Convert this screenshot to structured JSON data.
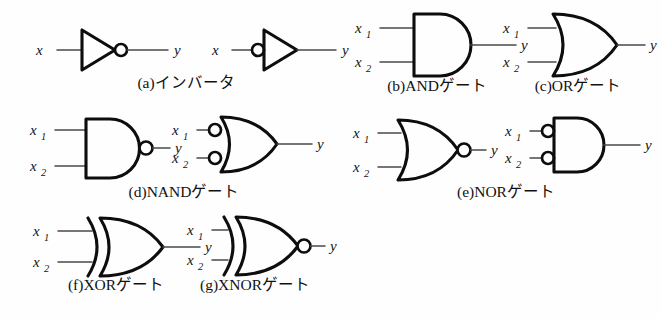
{
  "figure": {
    "background_color": "#fefefe",
    "stroke_color": "#0d0d0d",
    "wire_color": "#4a4a4a",
    "width": 661,
    "height": 318
  },
  "labels": {
    "input_x": "x",
    "input_x1_base": "x",
    "input_x1_sub": "1",
    "input_x2_base": "x",
    "input_x2_sub": "2",
    "output_y": "y"
  },
  "gates": [
    {
      "key": "a",
      "caption": "(a)インバータ",
      "name": "inverter",
      "inputs": [
        "x"
      ],
      "output": "y",
      "variants": [
        "triangle-with-output-bubble",
        "triangle-with-input-bubble"
      ]
    },
    {
      "key": "b",
      "caption": "(b)ANDゲート",
      "name": "and-gate",
      "inputs": [
        "x1",
        "x2"
      ],
      "output": "y",
      "variants": [
        "and-shape"
      ]
    },
    {
      "key": "c",
      "caption": "(c)ORゲート",
      "name": "or-gate",
      "inputs": [
        "x1",
        "x2"
      ],
      "output": "y",
      "variants": [
        "or-shape"
      ]
    },
    {
      "key": "d",
      "caption": "(d)NANDゲート",
      "name": "nand-gate",
      "inputs": [
        "x1",
        "x2"
      ],
      "output": "y",
      "variants": [
        "and-with-output-bubble",
        "or-with-input-bubbles"
      ]
    },
    {
      "key": "e",
      "caption": "(e)NORゲート",
      "name": "nor-gate",
      "inputs": [
        "x1",
        "x2"
      ],
      "output": "y",
      "variants": [
        "or-with-output-bubble",
        "and-with-input-bubbles"
      ]
    },
    {
      "key": "f",
      "caption": "(f)XORゲート",
      "name": "xor-gate",
      "inputs": [
        "x1",
        "x2"
      ],
      "output": "y",
      "variants": [
        "xor-shape"
      ]
    },
    {
      "key": "g",
      "caption": "(g)XNORゲート",
      "name": "xnor-gate",
      "inputs": [
        "x1",
        "x2"
      ],
      "output": "y",
      "variants": [
        "xor-with-output-bubble"
      ]
    }
  ]
}
